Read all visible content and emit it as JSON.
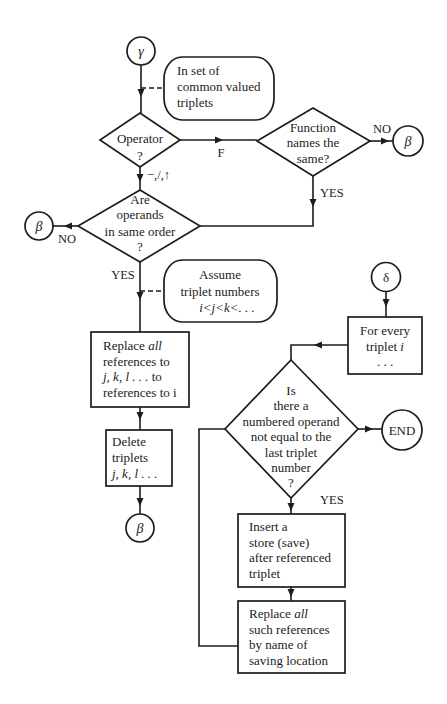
{
  "figure": {
    "connectors": {
      "gamma_entry": "γ",
      "beta_from_function": "β",
      "beta_from_operands": "β",
      "beta_after_delete": "β",
      "delta_entry": "δ",
      "end": "END"
    },
    "annotations": {
      "common_valued": [
        "In set of",
        "common valued",
        "triplets"
      ],
      "assume_order": [
        "Assume",
        "triplet numbers",
        "i<j<k<. . ."
      ]
    },
    "decisions": {
      "operator": [
        "Operator",
        "?"
      ],
      "function_names": [
        "Function",
        "names the",
        "same?"
      ],
      "operand_order": [
        "Are",
        "operands",
        "in same order",
        "?"
      ],
      "numbered_operand": [
        "Is",
        "there a",
        "numbered operand",
        "not equal to the",
        "last triplet",
        "number",
        "?"
      ]
    },
    "processes": {
      "replace_refs": {
        "l1a": "Replace ",
        "l1b": "all",
        "l2": "references to",
        "l3a": "j, k, l . . .",
        "l3b": " to",
        "l4": "references to i"
      },
      "delete_triplets": {
        "l1": "Delete",
        "l2": "triplets",
        "l3": "j, k, l . . ."
      },
      "for_every": {
        "l1": "For every",
        "l2a": "triplet ",
        "l2b": "i",
        "l3": ". . ."
      },
      "insert_store": [
        "Insert a",
        "store (save)",
        "after referenced",
        "triplet"
      ],
      "replace_such": {
        "l1a": "Replace ",
        "l1b": "all",
        "l2": "such references",
        "l3": "by name of",
        "l4": "saving location"
      }
    },
    "edge_labels": {
      "operator_f": "F",
      "operator_arith": "−,/,↑",
      "function_no": "NO",
      "function_yes": "YES",
      "operands_no": "NO",
      "operands_yes": "YES",
      "numbered_yes": "YES"
    }
  }
}
